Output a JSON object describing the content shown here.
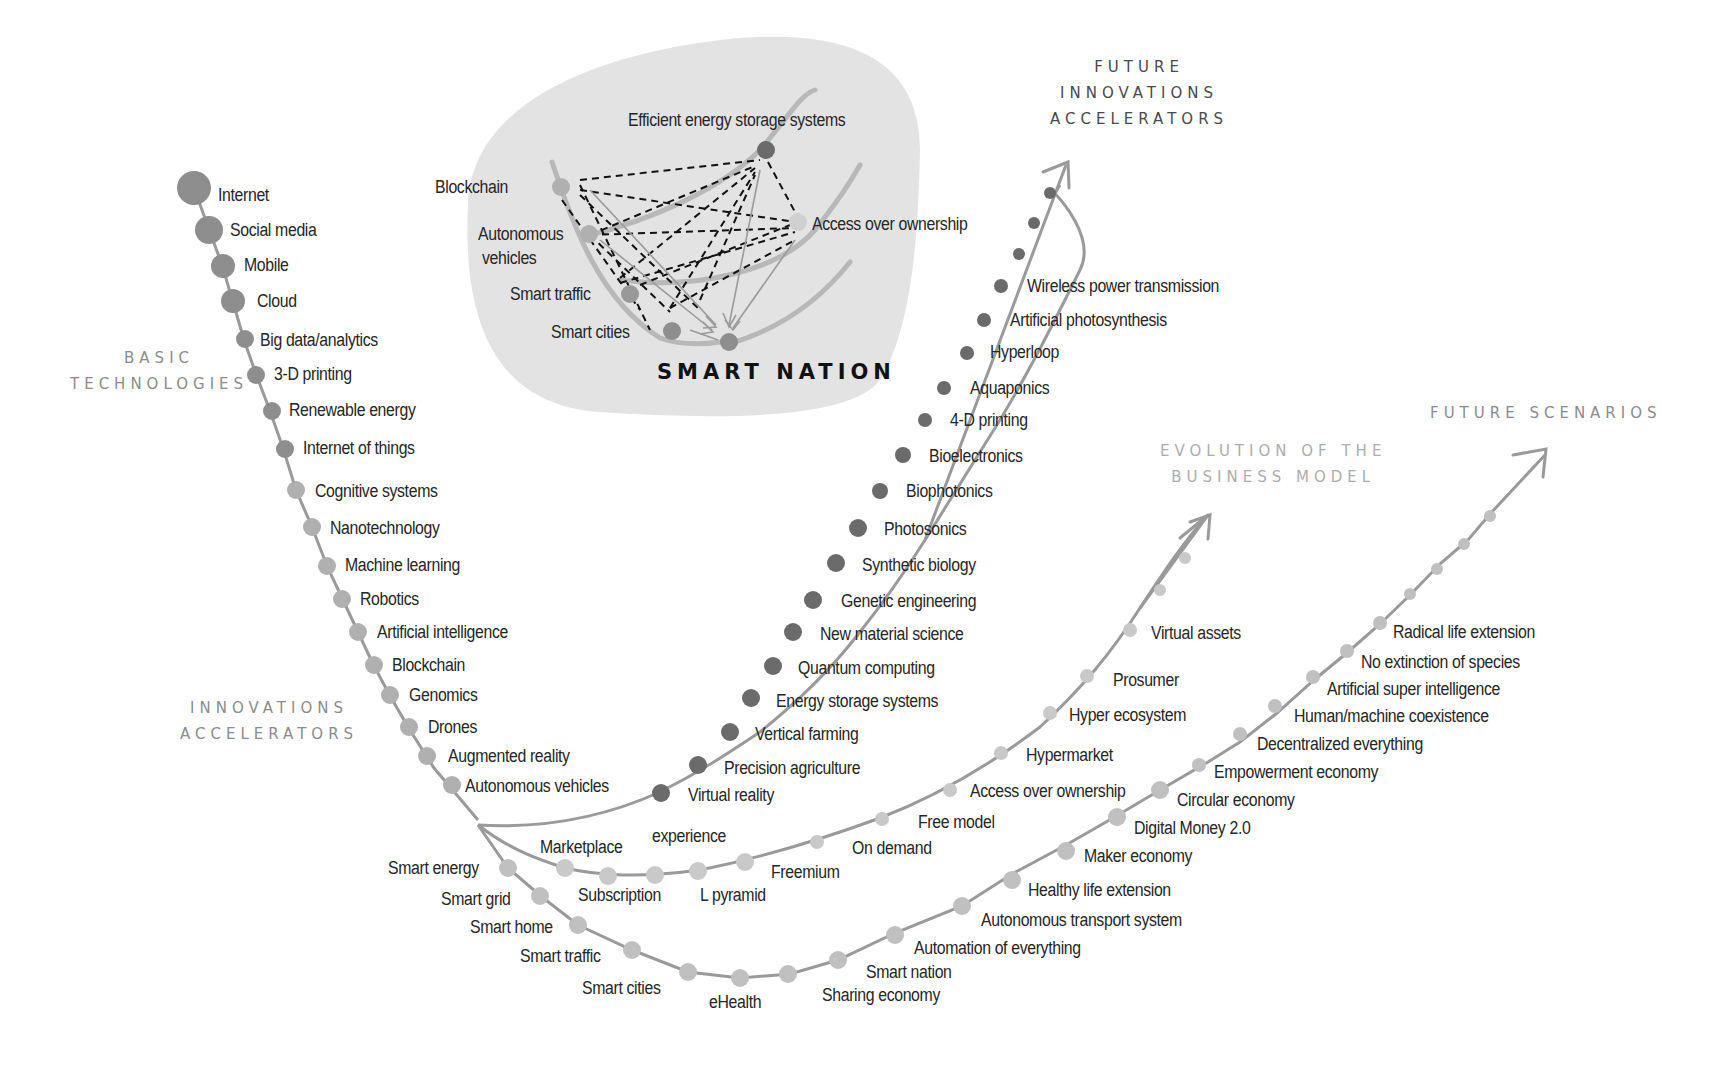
{
  "colors": {
    "background": "#ffffff",
    "blob": "#e3e3e3",
    "curve": "#9a9a9a",
    "dot_dark": "#6b6b6b",
    "dot_mid": "#8e8e8e",
    "dot_light": "#b4b4b4",
    "dot_pale": "#c9c9c9",
    "text": "#262626"
  },
  "section_titles": {
    "basic_technologies": "BASIC\nTECHNOLOGIES",
    "innovations_accelerators": "INNOVATIONS\nACCELERATORS",
    "future_innovations_accelerators": "FUTURE\nINNOVATIONS\nACCELERATORS",
    "evolution_business_model": "EVOLUTION OF THE\nBUSINESS MODEL",
    "future_scenarios": "FUTURE SCENARIOS"
  },
  "smart_nation": {
    "title": "SMART NATION",
    "nodes": {
      "efficient_energy": "Efficient energy storage systems",
      "blockchain": "Blockchain",
      "autonomous_vehicles_1": "Autonomous",
      "autonomous_vehicles_2": "vehicles",
      "smart_traffic": "Smart traffic",
      "smart_cities": "Smart cities",
      "access_over_ownership": "Access over ownership"
    }
  },
  "basic_technologies": [
    "Internet",
    "Social media",
    "Mobile",
    "Cloud",
    "Big data/analytics",
    "3-D printing",
    "Renewable energy",
    "Internet of things"
  ],
  "innovations_accelerators": [
    "Cognitive systems",
    "Nanotechnology",
    "Machine learning",
    "Robotics",
    "Artificial intelligence",
    "Blockchain",
    "Genomics",
    "Drones",
    "Augmented reality",
    "Autonomous vehicles"
  ],
  "future_innovations_accelerators": [
    "Virtual reality",
    "Precision agriculture",
    "Vertical farming",
    "Energy storage systems",
    "Quantum computing",
    "New material science",
    "Genetic engineering",
    "Synthetic biology",
    "Photosonics",
    "Biophotonics",
    "Bioelectronics",
    "4-D printing",
    "Aquaponics",
    "Hyperloop",
    "Artificial photosynthesis",
    "Wireless power transmission"
  ],
  "business_model": [
    "Marketplace",
    "experience",
    "Subscription",
    "L pyramid",
    "Freemium",
    "On demand",
    "Free model",
    "Access over ownership",
    "Hypermarket",
    "Hyper ecosystem",
    "Prosumer",
    "Virtual assets"
  ],
  "future_scenarios": [
    "Smart energy",
    "Smart grid",
    "Smart home",
    "Smart traffic",
    "Smart cities",
    "eHealth",
    "Sharing economy",
    "Smart nation",
    "Automation of everything",
    "Autonomous transport system",
    "Healthy life extension",
    "Maker economy",
    "Digital Money 2.0",
    "Circular economy",
    "Empowerment economy",
    "Decentralized everything",
    "Human/machine coexistence",
    "Artificial super intelligence",
    "No extinction of species",
    "Radical life extension"
  ]
}
